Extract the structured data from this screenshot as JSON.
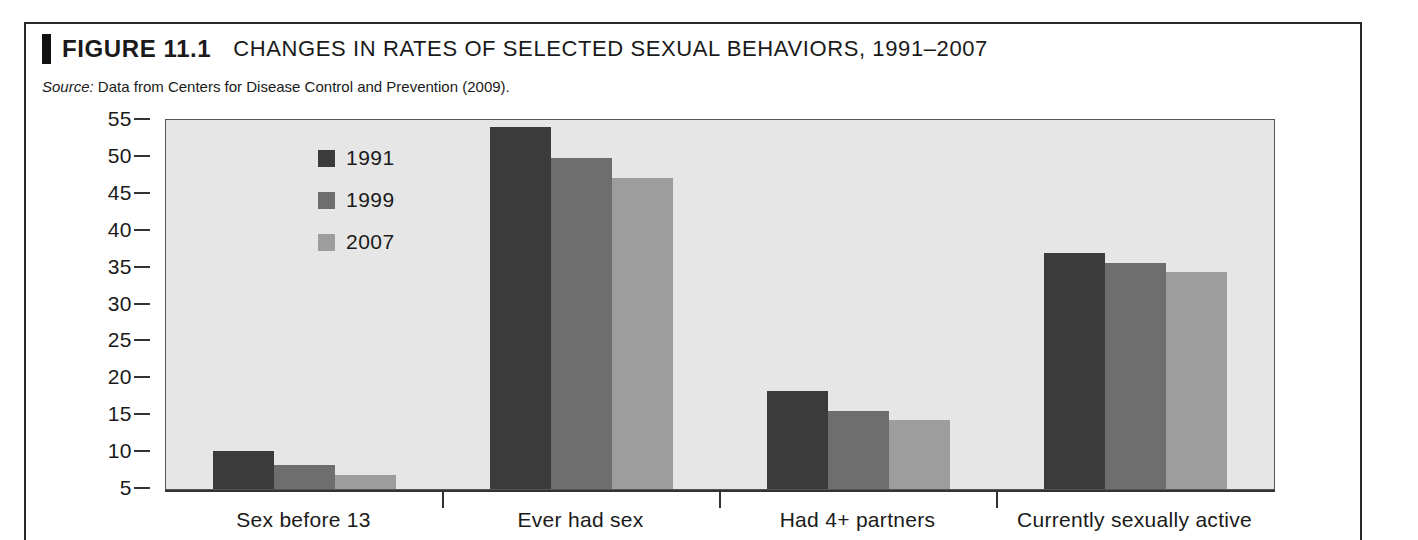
{
  "figure": {
    "number": "FIGURE 11.1",
    "title": "CHANGES IN RATES OF SELECTED SEXUAL BEHAVIORS, 1991–2007",
    "source_label": "Source:",
    "source_text": " Data from Centers for Disease Control and Prevention (2009)."
  },
  "chart_data": {
    "type": "bar",
    "title": "CHANGES IN RATES OF SELECTED SEXUAL BEHAVIORS, 1991–2007",
    "xlabel": "",
    "ylabel": "",
    "ylim": [
      5,
      55
    ],
    "yticks": [
      5,
      10,
      15,
      20,
      25,
      30,
      35,
      40,
      45,
      50,
      55
    ],
    "ytick_labels": [
      "5",
      "10",
      "15",
      "20",
      "25",
      "30",
      "35",
      "40",
      "45",
      "50",
      "55"
    ],
    "grid": false,
    "legend_position": "upper-left-inside",
    "categories": [
      "Sex before 13",
      "Ever had sex",
      "Had 4+ partners",
      "Currently sexually active"
    ],
    "series": [
      {
        "name": "1991",
        "color": "#3b3b3b",
        "values": [
          10.2,
          54.1,
          18.3,
          37.0
        ]
      },
      {
        "name": "1999",
        "color": "#6e6e6e",
        "values": [
          8.3,
          49.9,
          15.6,
          35.6
        ]
      },
      {
        "name": "2007",
        "color": "#9d9d9d",
        "values": [
          6.9,
          47.2,
          14.4,
          34.4
        ]
      }
    ],
    "plot_background": "#e6e6e6",
    "axis_color": "#333333"
  }
}
